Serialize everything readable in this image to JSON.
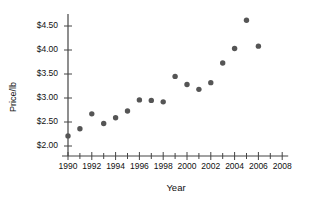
{
  "chart_data": {
    "type": "scatter",
    "title": "",
    "xlabel": "Year",
    "ylabel": "Price/lb",
    "xlim": [
      1989,
      2009
    ],
    "ylim": [
      1.85,
      4.75
    ],
    "grid": false,
    "legend": "none",
    "marker_color": "#555555",
    "axis_color": "#444444",
    "x_ticks": [
      1990,
      1992,
      1994,
      1996,
      1998,
      2000,
      2002,
      2004,
      2006,
      2008
    ],
    "x_tick_labels": [
      "1990",
      "1992",
      "1994",
      "1996",
      "1998",
      "2000",
      "2002",
      "2004",
      "2006",
      "2008"
    ],
    "x_minor_ticks": [
      1991,
      1993,
      1995,
      1997,
      1999,
      2001,
      2003,
      2005,
      2007
    ],
    "y_ticks": [
      2.0,
      2.5,
      3.0,
      3.5,
      4.0,
      4.5
    ],
    "y_tick_labels": [
      "$2.00",
      "$2.50",
      "$3.00",
      "$3.50",
      "$4.00",
      "$4.50"
    ],
    "x": [
      1990,
      1991,
      1992,
      1993,
      1994,
      1995,
      1996,
      1997,
      1998,
      1999,
      2000,
      2001,
      2002,
      2003,
      2004,
      2005,
      2006
    ],
    "values": [
      2.21,
      2.36,
      2.67,
      2.47,
      2.59,
      2.73,
      2.96,
      2.95,
      2.92,
      3.45,
      3.28,
      3.18,
      3.32,
      3.73,
      4.03,
      4.62,
      4.08
    ],
    "points": [
      {
        "year": 1990,
        "price": 2.21
      },
      {
        "year": 1991,
        "price": 2.36
      },
      {
        "year": 1992,
        "price": 2.67
      },
      {
        "year": 1993,
        "price": 2.47
      },
      {
        "year": 1994,
        "price": 2.59
      },
      {
        "year": 1995,
        "price": 2.73
      },
      {
        "year": 1996,
        "price": 2.96
      },
      {
        "year": 1997,
        "price": 2.95
      },
      {
        "year": 1998,
        "price": 2.92
      },
      {
        "year": 1999,
        "price": 3.45
      },
      {
        "year": 2000,
        "price": 3.28
      },
      {
        "year": 2001,
        "price": 3.18
      },
      {
        "year": 2002,
        "price": 3.32
      },
      {
        "year": 2003,
        "price": 3.73
      },
      {
        "year": 2004,
        "price": 4.03
      },
      {
        "year": 2005,
        "price": 4.62
      },
      {
        "year": 2006,
        "price": 4.08
      }
    ]
  }
}
